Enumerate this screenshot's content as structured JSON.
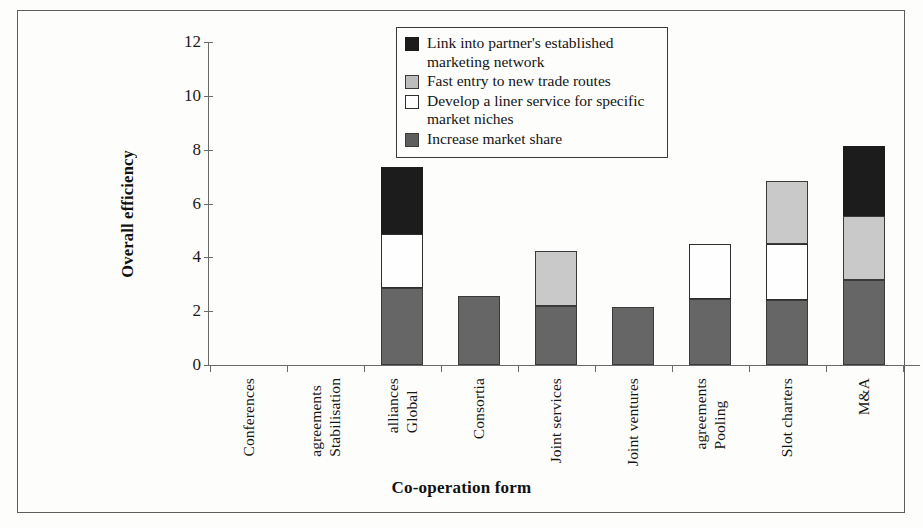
{
  "chart_data": {
    "type": "bar",
    "stacked": true,
    "title": "",
    "xlabel": "Co-operation form",
    "ylabel": "Overall efficiency",
    "ylim": [
      0,
      12
    ],
    "yticks": [
      0,
      2,
      4,
      6,
      8,
      10,
      12
    ],
    "grid": false,
    "legend_position": "top-center",
    "categories": [
      "Conferences",
      "Stabilisation agreements",
      "Global alliances",
      "Consortia",
      "Joint services",
      "Joint ventures",
      "Pooling agreements",
      "Slot charters",
      "M&A"
    ],
    "category_lines": [
      [
        "Conferences"
      ],
      [
        "Stabilisation",
        "agreements"
      ],
      [
        "Global",
        "alliances"
      ],
      [
        "Consortia"
      ],
      [
        "Joint services"
      ],
      [
        "Joint ventures"
      ],
      [
        "Pooling",
        "agreements"
      ],
      [
        "Slot charters"
      ],
      [
        "M&A"
      ]
    ],
    "series": [
      {
        "name": "Increase market share",
        "color": "#666666",
        "swatch": "darkgray",
        "values": [
          0,
          0,
          2.85,
          2.55,
          2.2,
          2.15,
          2.45,
          2.4,
          3.15
        ]
      },
      {
        "name": "Develop a liner service for specific market niches",
        "color": "#fefefe",
        "swatch": "white",
        "values": [
          0,
          0,
          2.0,
          0,
          0,
          0,
          2.05,
          2.1,
          0
        ]
      },
      {
        "name": "Fast entry to new trade routes",
        "color": "#c9c9c9",
        "swatch": "lightgray",
        "values": [
          0,
          0,
          0,
          0,
          2.05,
          0,
          0,
          2.35,
          2.4
        ]
      },
      {
        "name": "Link into partner's established marketing network",
        "color": "#1c1c1c",
        "swatch": "black",
        "values": [
          0,
          0,
          2.5,
          0,
          0,
          0,
          0,
          0,
          2.6
        ]
      }
    ],
    "totals": [
      0,
      0,
      7.35,
      2.55,
      4.25,
      2.15,
      4.5,
      6.85,
      8.15
    ]
  },
  "legend": {
    "entries": [
      {
        "swatch": "black",
        "label": "Link into partner's established marketing network"
      },
      {
        "swatch": "lightgray",
        "label": "Fast entry to new trade routes"
      },
      {
        "swatch": "white",
        "label": "Develop a liner service for specific market niches"
      },
      {
        "swatch": "darkgray",
        "label": "Increase market share"
      }
    ]
  },
  "axes": {
    "y_title": "Overall efficiency",
    "x_title": "Co-operation form",
    "y_tick_labels": [
      "0",
      "2",
      "4",
      "6",
      "8",
      "10",
      "12"
    ]
  }
}
